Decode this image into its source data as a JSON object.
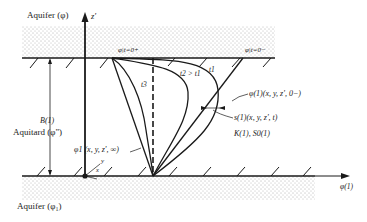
{
  "labels": {
    "aquifer_top": "Aquifer (φ)",
    "aquifer_bottom": "Aquifer (φ₁)",
    "aquitard": "Aquitard (φ\")",
    "z_axis": "z'",
    "phi_axis": "φ(1)",
    "thickness": "B(1)",
    "phi_t0plus": "φ|t=0+",
    "phi_t0minus": "φ|t=0−",
    "t1": "t1",
    "t2_gt_t1": "t2 > t1",
    "t3": "t3",
    "initial_head": "φ(1)(x, y, z', 0−)",
    "drawdown": "s(1)(x, y, z', t)",
    "properties": "K(1), S0(1)",
    "steady_state": "φ1 (x, y, z', ∞)",
    "x_axis": "x",
    "y_axis": "y"
  },
  "colors": {
    "line": "#1a1a1a",
    "stipple": "#555555",
    "background": "#ffffff"
  }
}
